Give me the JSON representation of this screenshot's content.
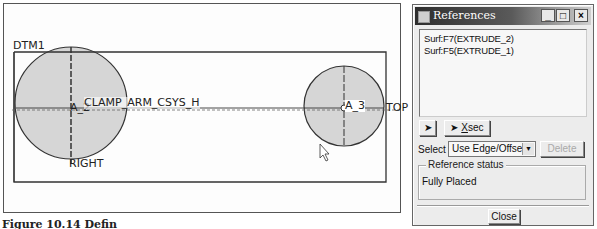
{
  "viewport": {
    "datum_labels": {
      "dtm": "DTM1",
      "csys": "CLAMP_ARM_CSYS_H",
      "axis_left": "A_2",
      "axis_right": "A_3",
      "right_plane": "RIGHT",
      "top_plane": "TOP"
    },
    "colors": {
      "circle_fill": "#d6d6d6",
      "line": "#333333"
    }
  },
  "caption": "Figure 10.14 Defin",
  "dialog": {
    "title": "References",
    "title_buttons": {
      "minimize": "_",
      "maximize": "□",
      "close": "×"
    },
    "references": [
      "Surf:F7(EXTRUDE_2)",
      "Surf:F5(EXTRUDE_1)"
    ],
    "pick_button_icon": "arrow-cursor-icon",
    "pick_sec_label": "sec",
    "pick_sec_prefix": "X",
    "select_label": "Select",
    "select_value": "Use Edge/Offset",
    "delete_label": "Delete",
    "status_group_label": "Reference status",
    "status_value": "Fully Placed",
    "close_label": "Close"
  }
}
